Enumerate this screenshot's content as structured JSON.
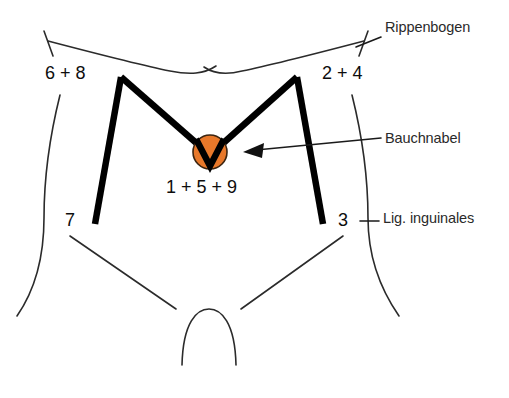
{
  "figure": {
    "background_color": "#ffffff",
    "outline_color": "#2b2b2b",
    "muscle_line_color": "#000000",
    "navel_color": "#e8782a",
    "navel_outline_color": "#3b2410"
  },
  "annotations": [
    {
      "id": "rippenbogen",
      "label": "Rippenbogen"
    },
    {
      "id": "bauchnabel",
      "label": "Bauchnabel"
    },
    {
      "id": "ligament",
      "label": "Lig. inguinales"
    }
  ],
  "point_labels": [
    {
      "id": "left-upper",
      "label": "6 + 8"
    },
    {
      "id": "right-upper",
      "label": "2 + 4"
    },
    {
      "id": "center",
      "label": "1 + 5 + 9"
    },
    {
      "id": "left-lower",
      "label": "7"
    },
    {
      "id": "right-lower",
      "label": "3"
    }
  ],
  "icons": {
    "arrow": "arrow-left-icon",
    "navel": "navel-marker-icon"
  }
}
